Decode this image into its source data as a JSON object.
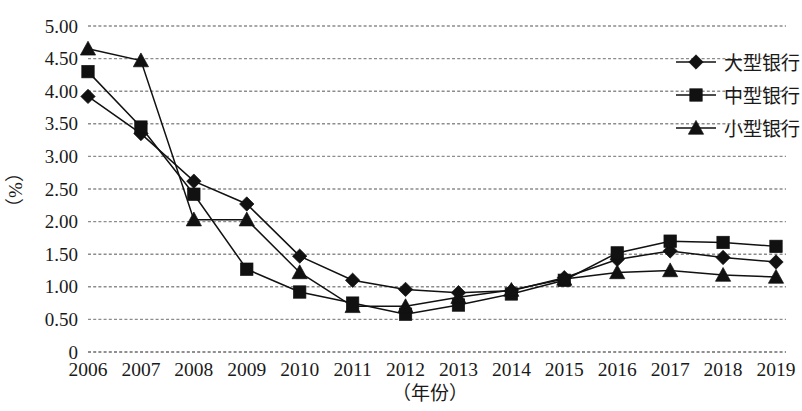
{
  "chart_data": {
    "type": "line",
    "title": "",
    "xlabel": "（年份）",
    "ylabel": "（%）",
    "x": [
      "2006",
      "2007",
      "2008",
      "2009",
      "2010",
      "2011",
      "2012",
      "2013",
      "2014",
      "2015",
      "2016",
      "2017",
      "2018",
      "2019"
    ],
    "categories": [
      "2006",
      "2007",
      "2008",
      "2009",
      "2010",
      "2011",
      "2012",
      "2013",
      "2014",
      "2015",
      "2016",
      "2017",
      "2018",
      "2019"
    ],
    "ylim": [
      0,
      5.0
    ],
    "yticks": [
      0,
      0.5,
      1.0,
      1.5,
      2.0,
      2.5,
      3.0,
      3.5,
      4.0,
      4.5,
      5.0
    ],
    "ytick_labels": [
      "0",
      "0.50",
      "1.00",
      "1.50",
      "2.00",
      "2.50",
      "3.00",
      "3.50",
      "4.00",
      "4.50",
      "5.00"
    ],
    "grid": true,
    "grid_style": "dashed-horizontal",
    "legend_position": "right",
    "series": [
      {
        "name": "大型银行",
        "marker": "diamond",
        "values": [
          3.92,
          3.35,
          2.62,
          2.27,
          1.47,
          1.1,
          0.96,
          0.91,
          0.94,
          1.14,
          1.42,
          1.55,
          1.45,
          1.38
        ]
      },
      {
        "name": "中型银行",
        "marker": "square",
        "values": [
          4.3,
          3.45,
          2.42,
          1.27,
          0.92,
          0.75,
          0.58,
          0.72,
          0.89,
          1.1,
          1.52,
          1.7,
          1.68,
          1.62
        ]
      },
      {
        "name": "小型银行",
        "marker": "triangle",
        "values": [
          4.65,
          4.47,
          2.03,
          2.03,
          1.22,
          0.7,
          0.7,
          0.84,
          0.95,
          1.12,
          1.22,
          1.25,
          1.18,
          1.15
        ]
      }
    ]
  },
  "legend": {
    "items": [
      {
        "label": "大型银行",
        "marker": "diamond"
      },
      {
        "label": "中型银行",
        "marker": "square"
      },
      {
        "label": "小型银行",
        "marker": "triangle"
      }
    ]
  },
  "axes": {
    "y_axis_title": "（%）",
    "x_axis_title": "（年份）"
  }
}
